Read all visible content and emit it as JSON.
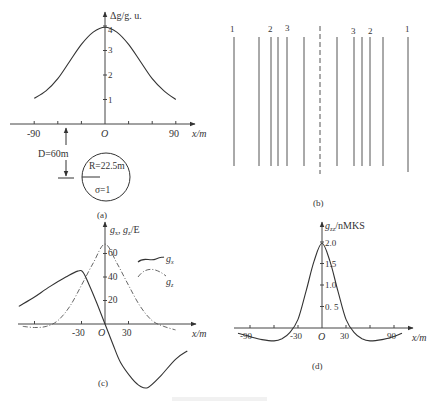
{
  "figure": {
    "caption_faint": "",
    "panels": {
      "a": {
        "label": "(a)"
      },
      "b": {
        "label": "(b)"
      },
      "c": {
        "label": "(c)"
      },
      "d": {
        "label": "(d)"
      }
    }
  },
  "chart_data": [
    {
      "id": "a",
      "type": "line",
      "title": "",
      "xlabel": "x/m",
      "ylabel": "Δg/g. u.",
      "xlim": [
        -110,
        110
      ],
      "ylim": [
        0,
        4.4
      ],
      "x_ticks": [
        -90,
        -60,
        -30,
        0,
        30,
        60,
        90
      ],
      "x_tick_labels": [
        "-90",
        "O",
        "90"
      ],
      "y_ticks": [
        1,
        2,
        3,
        4
      ],
      "y_tick_labels": [
        "1",
        "2",
        "3",
        "4"
      ],
      "series": [
        {
          "name": "Δg",
          "style": "solid",
          "x": [
            -90,
            -75,
            -60,
            -45,
            -30,
            -15,
            0,
            15,
            30,
            45,
            60,
            75,
            90
          ],
          "y": [
            1.05,
            1.35,
            1.85,
            2.55,
            3.25,
            3.75,
            3.95,
            3.75,
            3.25,
            2.55,
            1.85,
            1.35,
            1.0
          ]
        }
      ],
      "annotations": {
        "depth": "D=60m",
        "radius": "R=22.5m",
        "density": "σ=1",
        "origin": "O"
      },
      "grid": false
    },
    {
      "id": "b",
      "type": "diagram",
      "description": "Vertical line pattern symmetric about dashed center line",
      "line_labels_left": [
        "1",
        "2",
        "3"
      ],
      "line_labels_right": [
        "3",
        "2",
        "1"
      ]
    },
    {
      "id": "c",
      "type": "line",
      "xlabel": "x/m",
      "ylabel": "gx, gz/E",
      "xlim": [
        -110,
        110
      ],
      "ylim": [
        -60,
        70
      ],
      "x_ticks": [
        -90,
        -60,
        -30,
        0,
        30,
        60,
        90
      ],
      "x_tick_labels": [
        "-30",
        "O",
        "30"
      ],
      "y_ticks": [
        20,
        40,
        60
      ],
      "y_tick_labels": [
        "20",
        "40",
        "60"
      ],
      "legend": [
        {
          "name": "gx",
          "style": "solid"
        },
        {
          "name": "gz",
          "style": "dashdot"
        }
      ],
      "series": [
        {
          "name": "gx",
          "style": "solid",
          "x": [
            -110,
            -90,
            -70,
            -50,
            -35,
            -28,
            -20,
            -10,
            0,
            10,
            20,
            35,
            45,
            55,
            70,
            90,
            105
          ],
          "y": [
            15,
            23,
            32,
            40,
            45,
            44,
            33,
            17,
            0,
            -17,
            -33,
            -47,
            -53,
            -54,
            -45,
            -30,
            -23
          ]
        },
        {
          "name": "gz",
          "style": "dashdot",
          "x": [
            -105,
            -90,
            -75,
            -60,
            -45,
            -30,
            -15,
            0,
            15,
            30,
            45,
            60,
            75,
            90
          ],
          "y": [
            -2,
            -3,
            -2,
            3,
            15,
            33,
            52,
            68,
            52,
            33,
            15,
            3,
            -2,
            -5
          ]
        }
      ],
      "grid": false
    },
    {
      "id": "d",
      "type": "line",
      "xlabel": "x/m",
      "ylabel": "gzz/nMKS",
      "xlim": [
        -110,
        110
      ],
      "ylim": [
        -0.4,
        2.2
      ],
      "x_ticks": [
        -90,
        -60,
        -30,
        0,
        30,
        60,
        90
      ],
      "x_tick_labels": [
        "-90",
        "-30",
        "O",
        "30",
        "90"
      ],
      "y_ticks": [
        0.5,
        1.0,
        1.5,
        2.0
      ],
      "y_tick_labels": [
        "0. 5",
        "1.0",
        "1.5",
        "2.0"
      ],
      "series": [
        {
          "name": "gzz",
          "style": "solid",
          "x": [
            -105,
            -90,
            -75,
            -60,
            -50,
            -40,
            -30,
            -20,
            -10,
            0,
            10,
            20,
            30,
            40,
            50,
            60,
            75,
            90,
            100
          ],
          "y": [
            -0.12,
            -0.2,
            -0.27,
            -0.3,
            -0.25,
            -0.1,
            0.2,
            0.85,
            1.55,
            1.97,
            1.55,
            0.85,
            0.2,
            -0.1,
            -0.25,
            -0.3,
            -0.27,
            -0.2,
            -0.12
          ]
        }
      ],
      "grid": false
    }
  ]
}
